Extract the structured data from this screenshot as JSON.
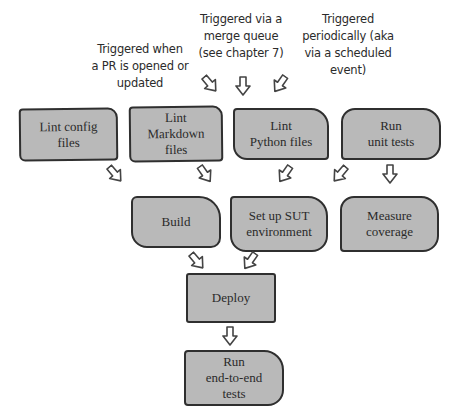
{
  "annotations": {
    "pr": "Triggered when\na PR is opened or\nupdated",
    "merge_queue": "Triggered via a\nmerge queue\n(see chapter 7)",
    "scheduled": "Triggered\nperiodically (aka\nvia a scheduled\nevent)"
  },
  "nodes": {
    "lint_config": "Lint config\nfiles",
    "lint_markdown": "Lint\nMarkdown\nfiles",
    "lint_python": "Lint\nPython files",
    "run_unit_tests": "Run\nunit tests",
    "build": "Build",
    "setup_sut": "Set up SUT\nenvironment",
    "measure_coverage": "Measure\ncoverage",
    "deploy": "Deploy",
    "run_e2e": "Run\nend-to-end\ntests"
  },
  "edges": [
    {
      "from": "pr_trigger",
      "to": "row1",
      "icon": "arrow-down-right-icon"
    },
    {
      "from": "merge_queue_trigger",
      "to": "row1",
      "icon": "arrow-down-icon"
    },
    {
      "from": "scheduled_trigger",
      "to": "row1",
      "icon": "arrow-down-left-icon"
    },
    {
      "from": "lint_config",
      "to": "build",
      "icon": "arrow-down-right-icon"
    },
    {
      "from": "lint_markdown",
      "to": "build",
      "icon": "arrow-down-right-icon"
    },
    {
      "from": "lint_python",
      "to": "setup_sut",
      "icon": "arrow-down-right-icon"
    },
    {
      "from": "run_unit_tests",
      "to": "setup_sut",
      "icon": "arrow-down-left-icon"
    },
    {
      "from": "run_unit_tests",
      "to": "measure_coverage",
      "icon": "arrow-down-icon"
    },
    {
      "from": "build",
      "to": "deploy",
      "icon": "arrow-down-right-icon"
    },
    {
      "from": "setup_sut",
      "to": "deploy",
      "icon": "arrow-down-left-icon"
    },
    {
      "from": "deploy",
      "to": "run_e2e",
      "icon": "arrow-down-icon"
    }
  ],
  "colors": {
    "box_fill": "#b9b9b9",
    "box_border": "#2f2f2f",
    "text": "#2a2a2a",
    "background": "#ffffff"
  }
}
